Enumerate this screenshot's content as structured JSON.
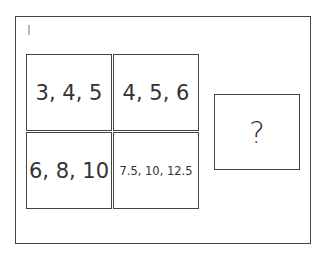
{
  "puzzle": {
    "label": "I",
    "cells": [
      {
        "text": "3, 4, 5"
      },
      {
        "text": "4, 5, 6"
      },
      {
        "text": "6, 8, 10"
      },
      {
        "text": "7.5, 10, 12.5"
      }
    ],
    "answer_box": {
      "text": "?"
    }
  }
}
